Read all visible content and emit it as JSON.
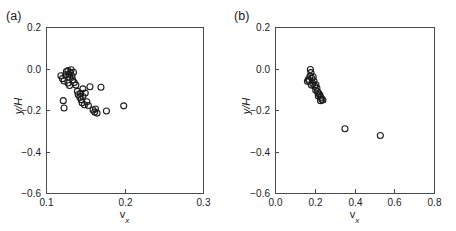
{
  "figure": {
    "panels": [
      {
        "id": "a",
        "label": "(a)",
        "axis_label_y": "y/H",
        "axis_label_x_var": "v",
        "axis_label_x_sub": "x"
      },
      {
        "id": "b",
        "label": "(b)",
        "axis_label_y": "y/H",
        "axis_label_x_var": "v",
        "axis_label_x_sub": "x"
      }
    ]
  },
  "chart_data": [
    {
      "type": "scatter",
      "title": "(a)",
      "xlabel": "v_x",
      "ylabel": "y/H",
      "xlim": [
        0.1,
        0.3
      ],
      "ylim": [
        -0.6,
        0.2
      ],
      "xticks": [
        0.1,
        0.2,
        0.3
      ],
      "xtick_labels": [
        "0.1",
        "0.2",
        "0.3"
      ],
      "yticks": [
        -0.6,
        -0.4,
        -0.2,
        0.0,
        0.2
      ],
      "ytick_labels": [
        "-0.6",
        "-0.4",
        "-0.2",
        "0.0",
        "0.2"
      ],
      "grid": false,
      "legend": "none",
      "marker": "open-circle",
      "marker_color": "#1a1a1a",
      "marker_size_px": 6,
      "points": [
        {
          "x": 0.119,
          "y": -0.035
        },
        {
          "x": 0.121,
          "y": -0.049
        },
        {
          "x": 0.123,
          "y": -0.06
        },
        {
          "x": 0.125,
          "y": -0.03
        },
        {
          "x": 0.126,
          "y": -0.015
        },
        {
          "x": 0.128,
          "y": -0.01
        },
        {
          "x": 0.129,
          "y": -0.028
        },
        {
          "x": 0.13,
          "y": -0.042
        },
        {
          "x": 0.131,
          "y": -0.02
        },
        {
          "x": 0.132,
          "y": -0.006
        },
        {
          "x": 0.133,
          "y": -0.036
        },
        {
          "x": 0.134,
          "y": -0.055
        },
        {
          "x": 0.135,
          "y": -0.018
        },
        {
          "x": 0.128,
          "y": -0.07
        },
        {
          "x": 0.13,
          "y": -0.082
        },
        {
          "x": 0.136,
          "y": -0.068
        },
        {
          "x": 0.138,
          "y": -0.08
        },
        {
          "x": 0.122,
          "y": -0.155
        },
        {
          "x": 0.123,
          "y": -0.19
        },
        {
          "x": 0.14,
          "y": -0.11
        },
        {
          "x": 0.141,
          "y": -0.125
        },
        {
          "x": 0.143,
          "y": -0.138
        },
        {
          "x": 0.144,
          "y": -0.12
        },
        {
          "x": 0.145,
          "y": -0.15
        },
        {
          "x": 0.146,
          "y": -0.165
        },
        {
          "x": 0.147,
          "y": -0.135
        },
        {
          "x": 0.149,
          "y": -0.175
        },
        {
          "x": 0.15,
          "y": -0.118
        },
        {
          "x": 0.152,
          "y": -0.16
        },
        {
          "x": 0.154,
          "y": -0.178
        },
        {
          "x": 0.147,
          "y": -0.098
        },
        {
          "x": 0.156,
          "y": -0.088
        },
        {
          "x": 0.16,
          "y": -0.2
        },
        {
          "x": 0.162,
          "y": -0.21
        },
        {
          "x": 0.163,
          "y": -0.195
        },
        {
          "x": 0.165,
          "y": -0.215
        },
        {
          "x": 0.17,
          "y": -0.09
        },
        {
          "x": 0.177,
          "y": -0.205
        },
        {
          "x": 0.199,
          "y": -0.18
        }
      ]
    },
    {
      "type": "scatter",
      "title": "(b)",
      "xlabel": "v_x",
      "ylabel": "y/H",
      "xlim": [
        0.0,
        0.8
      ],
      "ylim": [
        -0.6,
        0.2
      ],
      "xticks": [
        0.0,
        0.2,
        0.4,
        0.6,
        0.8
      ],
      "xtick_labels": [
        "0.0",
        "0.2",
        "0.4",
        "0.6",
        "0.8"
      ],
      "yticks": [
        -0.6,
        -0.4,
        -0.2,
        0.0,
        0.2
      ],
      "ytick_labels": [
        "-0.6",
        "-0.4",
        "-0.2",
        "0.0",
        "0.2"
      ],
      "grid": false,
      "legend": "none",
      "marker": "open-circle",
      "marker_color": "#1a1a1a",
      "marker_size_px": 6,
      "points": [
        {
          "x": 0.178,
          "y": -0.005
        },
        {
          "x": 0.181,
          "y": -0.02
        },
        {
          "x": 0.176,
          "y": -0.038
        },
        {
          "x": 0.168,
          "y": -0.052
        },
        {
          "x": 0.163,
          "y": -0.062
        },
        {
          "x": 0.172,
          "y": -0.058
        },
        {
          "x": 0.186,
          "y": -0.048
        },
        {
          "x": 0.192,
          "y": -0.04
        },
        {
          "x": 0.196,
          "y": -0.06
        },
        {
          "x": 0.19,
          "y": -0.072
        },
        {
          "x": 0.183,
          "y": -0.08
        },
        {
          "x": 0.2,
          "y": -0.085
        },
        {
          "x": 0.206,
          "y": -0.078
        },
        {
          "x": 0.211,
          "y": -0.095
        },
        {
          "x": 0.205,
          "y": -0.105
        },
        {
          "x": 0.214,
          "y": -0.112
        },
        {
          "x": 0.22,
          "y": -0.12
        },
        {
          "x": 0.218,
          "y": -0.132
        },
        {
          "x": 0.226,
          "y": -0.128
        },
        {
          "x": 0.231,
          "y": -0.14
        },
        {
          "x": 0.236,
          "y": -0.148
        },
        {
          "x": 0.229,
          "y": -0.155
        },
        {
          "x": 0.241,
          "y": -0.152
        },
        {
          "x": 0.352,
          "y": -0.29
        },
        {
          "x": 0.53,
          "y": -0.323
        }
      ]
    }
  ]
}
